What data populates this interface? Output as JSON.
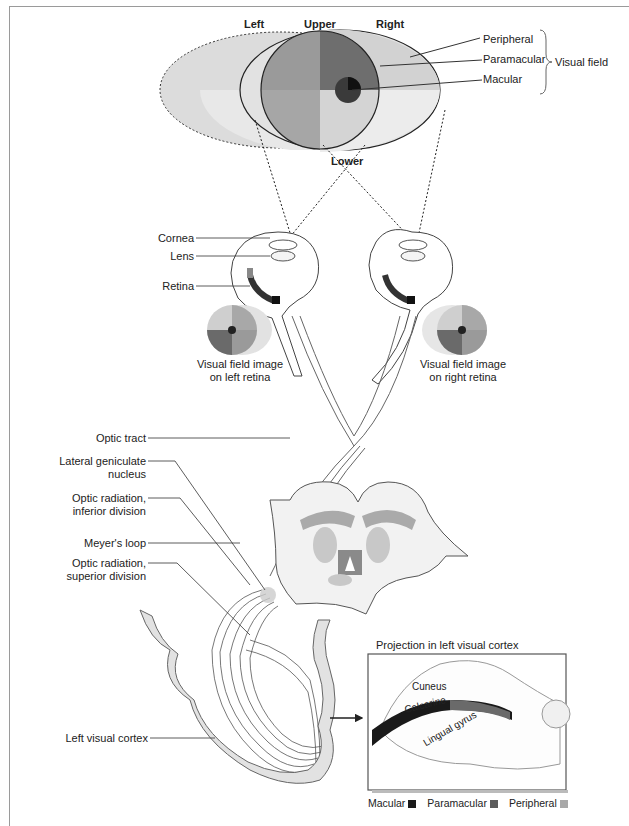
{
  "visual_field": {
    "directions": {
      "left": "Left",
      "upper": "Upper",
      "right": "Right",
      "lower": "Lower"
    },
    "zones": [
      "Peripheral",
      "Paramacular",
      "Macular"
    ],
    "group_label": "Visual field"
  },
  "eye_labels": {
    "cornea": "Cornea",
    "lens": "Lens",
    "retina": "Retina"
  },
  "retina_images": {
    "left": [
      "Visual field image",
      "on left retina"
    ],
    "right": [
      "Visual field image",
      "on right retina"
    ]
  },
  "pathway_labels": {
    "optic_tract": "Optic tract",
    "lgn": [
      "Lateral geniculate",
      "nucleus"
    ],
    "optic_radiation_inferior": [
      "Optic radiation,",
      "inferior division"
    ],
    "meyers_loop": "Meyer's loop",
    "optic_radiation_superior": [
      "Optic radiation,",
      "superior division"
    ],
    "left_visual_cortex": "Left visual cortex"
  },
  "inset": {
    "title": "Projection in left visual cortex",
    "regions": {
      "cuneus": "Cuneus",
      "calcarine": "Calcarine",
      "lingual": "Lingual gyrus"
    }
  },
  "legend": [
    {
      "label": "Macular",
      "color": "#1a1a1a"
    },
    {
      "label": "Paramacular",
      "color": "#5c5c5c"
    },
    {
      "label": "Peripheral",
      "color": "#a8a8a8"
    }
  ],
  "colors": {
    "macular": "#1a1a1a",
    "paramacular": "#6a6a6a",
    "peripheral_light": "#d8d8d8",
    "tissue": "#e6e6e6",
    "line": "#444444"
  }
}
